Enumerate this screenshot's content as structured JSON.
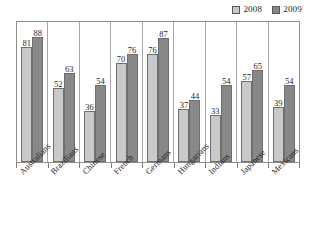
{
  "chart_data": {
    "type": "bar",
    "title": "",
    "subtitle": "",
    "xlabel": "",
    "ylabel": "",
    "ylim": [
      0,
      100
    ],
    "grid": false,
    "legend_position": "top-right",
    "categories": [
      "Australians",
      "Brazilians",
      "Chinese",
      "French",
      "Germans",
      "Hungarians",
      "Indians",
      "Japanese",
      "Mexicans"
    ],
    "series": [
      {
        "name": "2008",
        "color": "#c9c9c9",
        "values": [
          81,
          52,
          36,
          70,
          76,
          37,
          33,
          57,
          39
        ]
      },
      {
        "name": "2009",
        "color": "#888888",
        "values": [
          88,
          63,
          54,
          76,
          87,
          44,
          54,
          65,
          54
        ]
      }
    ]
  },
  "legend": {
    "items": [
      {
        "label": "2008",
        "swatch": "#c9c9c9"
      },
      {
        "label": "2009",
        "swatch": "#888888"
      }
    ]
  },
  "colors": {
    "series_2008": "#c9c9c9",
    "series_2009": "#888888",
    "frame": "#8f8f8f",
    "separator": "#a8a8a8",
    "text": "#1f1f1f"
  }
}
